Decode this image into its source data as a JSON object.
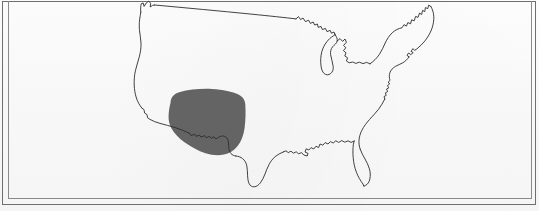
{
  "figure": {
    "kind": "map-figure",
    "caption": "",
    "width_px": 539,
    "height_px": 211,
    "background_color": "#fbfbfb"
  },
  "frame": {
    "style": "double-rule-rectangle",
    "outer_color": "#6f6f6f",
    "inner_color": "#8a8a8a",
    "line_count": 2
  },
  "map": {
    "outline_label": "United States national and coastal boundary",
    "outline_color": "#2c2c2c",
    "outline_width": 0.9,
    "features": [
      "pacific-northwest-coast",
      "california-coast",
      "us-mexico-border",
      "gulf-coast",
      "florida-peninsula",
      "atlantic-coast",
      "new-england-coast",
      "great-lakes",
      "us-canada-border"
    ]
  },
  "shaded_region": {
    "label": "Shaded range area — American Southwest",
    "fill_color": "#646464",
    "opacity": 1,
    "approx_states": [
      "Arizona",
      "New Mexico",
      "Southern California",
      "Southern Nevada",
      "Southern Utah"
    ],
    "shape": "rounded-blob",
    "extends_past_border": true
  },
  "legend": {
    "present": false,
    "entries": []
  },
  "labels": {
    "present": false,
    "items": []
  }
}
